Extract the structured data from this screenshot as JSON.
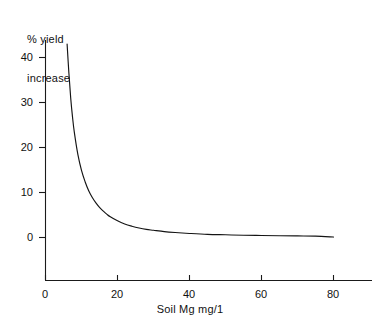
{
  "chart_data": {
    "type": "line",
    "title": "",
    "subtitle": "",
    "xlabel": "Soil Mg mg/1",
    "ylabel": "% yield increase",
    "ylabel_lines": [
      "% yield",
      "increase"
    ],
    "xlim": [
      0,
      90
    ],
    "ylim": [
      -6,
      45
    ],
    "grid": false,
    "legend": "none",
    "x_ticks": [
      0,
      20,
      40,
      60,
      80
    ],
    "x_tick_labels": [
      "0",
      "20",
      "40",
      "60",
      "80"
    ],
    "y_ticks": [
      0,
      10,
      20,
      30,
      40
    ],
    "y_tick_labels": [
      "0",
      "10",
      "20",
      "30",
      "40"
    ],
    "series": [
      {
        "name": "% yield increase",
        "color": "#141414",
        "x": [
          6.0,
          6.5,
          7.0,
          7.5,
          8.0,
          9.0,
          10.0,
          11.0,
          12.0,
          13.0,
          14.0,
          15.0,
          16.0,
          17.0,
          18.0,
          20.0,
          22.0,
          24.0,
          26.0,
          28.0,
          30.0,
          33.0,
          36.0,
          40.0,
          45.0,
          50.0,
          55.0,
          60.0,
          65.0,
          70.0,
          75.0,
          80.0
        ],
        "y": [
          43.0,
          36.5,
          31.0,
          26.8,
          23.4,
          18.4,
          14.9,
          12.4,
          10.4,
          8.9,
          7.7,
          6.7,
          5.9,
          5.2,
          4.6,
          3.7,
          3.0,
          2.5,
          2.1,
          1.8,
          1.6,
          1.3,
          1.1,
          0.9,
          0.7,
          0.6,
          0.5,
          0.45,
          0.4,
          0.35,
          0.3,
          0.1
        ]
      }
    ]
  },
  "axes": {
    "x_axis_color": "#1a1a1a",
    "y_axis_color": "#1a1a1a",
    "line_color": "#141414"
  }
}
